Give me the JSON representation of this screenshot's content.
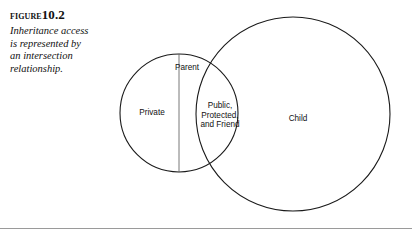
{
  "figure": {
    "label_word": "Figure",
    "number": "10.2",
    "description_lines": [
      "Inheritance access",
      "is represented by",
      "an intersection",
      "relationship."
    ]
  },
  "diagram": {
    "type": "venn",
    "stroke_color": "#1a1a1a",
    "background": "#ffffff",
    "divider_color": "#555555",
    "rule_color": "#9a9a9a",
    "circles": [
      {
        "name": "parent-circle",
        "label": "Parent",
        "cx": 179,
        "cy": 113,
        "r": 59
      },
      {
        "name": "child-circle",
        "label": "Child",
        "cx": 293,
        "cy": 114,
        "r": 97
      }
    ],
    "regions": [
      {
        "name": "private-region",
        "label": "Private"
      },
      {
        "name": "intersection-region",
        "label_lines": [
          "Public,",
          "Protected,",
          "and Friend"
        ]
      },
      {
        "name": "child-region",
        "label": "Child"
      }
    ],
    "divider_line": {
      "x": 179,
      "y1": 54,
      "y2": 172
    }
  }
}
